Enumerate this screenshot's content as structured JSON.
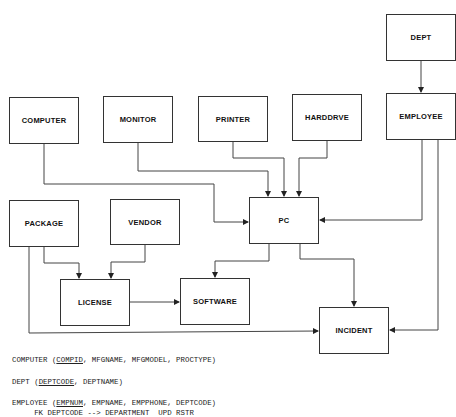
{
  "diagram": {
    "type": "entity-relationship",
    "entities": [
      {
        "id": "computer",
        "label": "COMPUTER",
        "x": 9,
        "y": 97,
        "w": 70,
        "h": 47
      },
      {
        "id": "monitor",
        "label": "MONITOR",
        "x": 103,
        "y": 96,
        "w": 70,
        "h": 47
      },
      {
        "id": "printer",
        "label": "PRINTER",
        "x": 198,
        "y": 96,
        "w": 70,
        "h": 46
      },
      {
        "id": "harddrve",
        "label": "HARDDRVE",
        "x": 292,
        "y": 94,
        "w": 70,
        "h": 47
      },
      {
        "id": "dept",
        "label": "DEPT",
        "x": 386,
        "y": 14,
        "w": 70,
        "h": 47
      },
      {
        "id": "employee",
        "label": "EMPLOYEE",
        "x": 386,
        "y": 93,
        "w": 70,
        "h": 47
      },
      {
        "id": "package",
        "label": "PACKAGE",
        "x": 9,
        "y": 200,
        "w": 70,
        "h": 47
      },
      {
        "id": "vendor",
        "label": "VENDOR",
        "x": 110,
        "y": 199,
        "w": 70,
        "h": 46
      },
      {
        "id": "pc",
        "label": "PC",
        "x": 249,
        "y": 197,
        "w": 70,
        "h": 47
      },
      {
        "id": "license",
        "label": "LICENSE",
        "x": 60,
        "y": 279,
        "w": 70,
        "h": 47
      },
      {
        "id": "software",
        "label": "SOFTWARE",
        "x": 180,
        "y": 278,
        "w": 70,
        "h": 47
      },
      {
        "id": "incident",
        "label": "INCIDENT",
        "x": 319,
        "y": 307,
        "w": 70,
        "h": 47
      }
    ],
    "relationships": [
      {
        "from": "DEPT",
        "to": "EMPLOYEE"
      },
      {
        "from": "COMPUTER",
        "to": "PC"
      },
      {
        "from": "MONITOR",
        "to": "PC"
      },
      {
        "from": "PRINTER",
        "to": "PC"
      },
      {
        "from": "HARDDRVE",
        "to": "PC"
      },
      {
        "from": "EMPLOYEE",
        "to": "PC"
      },
      {
        "from": "EMPLOYEE",
        "to": "INCIDENT"
      },
      {
        "from": "PACKAGE",
        "to": "LICENSE"
      },
      {
        "from": "VENDOR",
        "to": "LICENSE"
      },
      {
        "from": "LICENSE",
        "to": "SOFTWARE"
      },
      {
        "from": "PC",
        "to": "SOFTWARE"
      },
      {
        "from": "PC",
        "to": "INCIDENT"
      },
      {
        "from": "PACKAGE",
        "to": "INCIDENT"
      }
    ]
  },
  "schema": {
    "line1": {
      "name": "COMPUTER (",
      "key": "COMPID",
      "rest": ", MFGNAME, MFGMODEL, PROCTYPE)"
    },
    "line2": {
      "name": "DEPT (",
      "key": "DEPTCODE",
      "rest": ", DEPTNAME)"
    },
    "line3": {
      "name": "EMPLOYEE (",
      "key": "EMPNUM",
      "rest": ", EMPNAME, EMPPHONE, DEPTCODE)"
    },
    "line4": "     FK DEPTCODE --> DEPARTMENT  UPD RSTR"
  }
}
